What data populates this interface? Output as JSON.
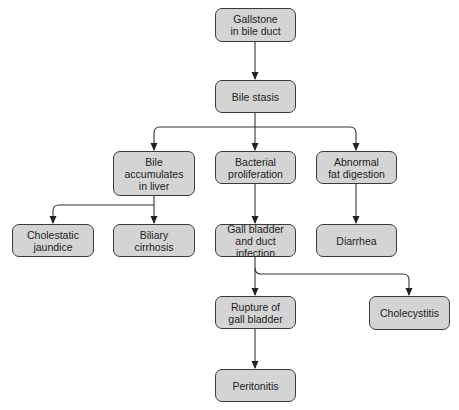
{
  "nodes": {
    "gallstone": "Gallstone\nin bile duct",
    "stasis": "Bile stasis",
    "accumulates": "Bile\naccumulates\nin liver",
    "bacterial": "Bacterial\nproliferation",
    "abnormal": "Abnormal\nfat digestion",
    "cholestatic": "Cholestatic\njaundice",
    "biliary": "Biliary\ncirrhosis",
    "infection": "Gall bladder\nand duct infection",
    "diarrhea": "Diarrhea",
    "rupture": "Rupture of\ngall bladder",
    "cholecystitis": "Cholecystitis",
    "peritonitis": "Peritonitis"
  },
  "colors": {
    "node_fill": "#d4d4d4",
    "stroke": "#3a3a3a"
  }
}
